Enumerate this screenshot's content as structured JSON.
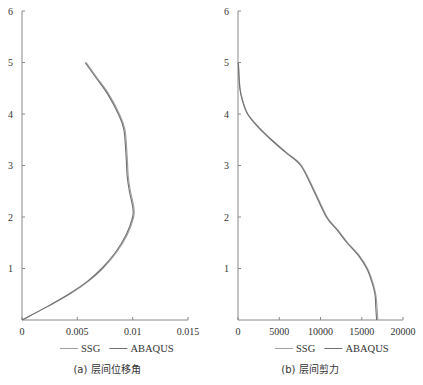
{
  "chart_data": [
    {
      "type": "line",
      "title": "",
      "caption": "(a) 层间位移角",
      "xlabel": "",
      "ylabel": "",
      "xlim": [
        0,
        0.015
      ],
      "ylim": [
        0,
        6
      ],
      "xticks": [
        0,
        0.005,
        0.01,
        0.015
      ],
      "xtick_labels": [
        "0",
        "0.005",
        "0.01",
        "0.015"
      ],
      "yticks": [
        1,
        2,
        3,
        4,
        5,
        6
      ],
      "ytick_labels": [
        "1",
        "2",
        "3",
        "4",
        "5",
        "6"
      ],
      "grid": false,
      "legend": "bottom",
      "series": [
        {
          "name": "SSG",
          "color": "#a0a0a0",
          "x": [
            0,
            0.0022,
            0.0043,
            0.006,
            0.0073,
            0.0085,
            0.0095,
            0.0101,
            0.0101,
            0.0098,
            0.0096,
            0.0095,
            0.0093,
            0.0088,
            0.0078,
            0.0068,
            0.0058
          ],
          "y": [
            0,
            0.25,
            0.5,
            0.75,
            1.0,
            1.3,
            1.65,
            2.0,
            2.2,
            2.5,
            2.8,
            3.2,
            3.7,
            4.0,
            4.4,
            4.7,
            5.0
          ]
        },
        {
          "name": "ABAQUS",
          "color": "#707070",
          "x": [
            0,
            0.0022,
            0.0042,
            0.0059,
            0.0072,
            0.0084,
            0.0094,
            0.01,
            0.01,
            0.0097,
            0.0095,
            0.0094,
            0.0092,
            0.0087,
            0.0077,
            0.0067,
            0.0057
          ],
          "y": [
            0,
            0.25,
            0.5,
            0.75,
            1.0,
            1.3,
            1.65,
            2.0,
            2.2,
            2.5,
            2.8,
            3.2,
            3.7,
            4.0,
            4.4,
            4.7,
            5.0
          ]
        }
      ]
    },
    {
      "type": "line",
      "title": "",
      "caption": "(b) 层间剪力",
      "xlabel": "",
      "ylabel": "",
      "xlim": [
        0,
        20000
      ],
      "ylim": [
        0,
        6
      ],
      "xticks": [
        0,
        5000,
        10000,
        15000,
        20000
      ],
      "xtick_labels": [
        "0",
        "5000",
        "10000",
        "15000",
        "20000"
      ],
      "yticks": [
        1,
        2,
        3,
        4,
        5,
        6
      ],
      "ytick_labels": [
        "1",
        "2",
        "3",
        "4",
        "5",
        "6"
      ],
      "grid": false,
      "legend": "bottom",
      "series": [
        {
          "name": "SSG",
          "color": "#a0a0a0",
          "x": [
            16950,
            16850,
            16700,
            16300,
            15700,
            14700,
            13300,
            12100,
            10800,
            9300,
            7700,
            5900,
            4100,
            2500,
            1200,
            600,
            250,
            50
          ],
          "y": [
            0,
            0.25,
            0.5,
            0.75,
            1.0,
            1.25,
            1.5,
            1.75,
            2.0,
            2.5,
            3.0,
            3.25,
            3.5,
            3.75,
            4.0,
            4.25,
            4.5,
            5.0
          ]
        },
        {
          "name": "ABAQUS",
          "color": "#707070",
          "x": [
            16800,
            16700,
            16600,
            16200,
            15600,
            14600,
            13200,
            12000,
            10700,
            9200,
            7600,
            5800,
            4000,
            2400,
            1150,
            550,
            220,
            30
          ],
          "y": [
            0,
            0.25,
            0.5,
            0.75,
            1.0,
            1.25,
            1.5,
            1.75,
            2.0,
            2.5,
            3.0,
            3.25,
            3.5,
            3.75,
            4.0,
            4.25,
            4.5,
            5.0
          ]
        }
      ]
    }
  ]
}
